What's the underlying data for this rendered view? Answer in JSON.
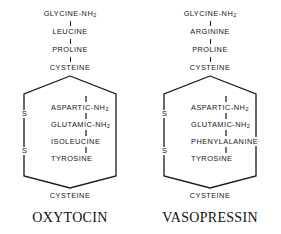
{
  "figure": {
    "background_color": "#ffffff",
    "ink_color": "#1a1a1a",
    "sulfur_symbol": "S"
  },
  "structures": [
    {
      "id": "oxytocin",
      "title": "OXYTOCIN",
      "tail": [
        {
          "name": "GLYCINE",
          "amide": "-NH",
          "sub": "2"
        },
        {
          "name": "LEUCINE",
          "amide": "",
          "sub": ""
        },
        {
          "name": "PROLINE",
          "amide": "",
          "sub": ""
        },
        {
          "name": "CYSTEINE",
          "amide": "",
          "sub": ""
        }
      ],
      "ring_residues": [
        {
          "name": "ASPARTIC",
          "amide": "-NH",
          "sub": "2"
        },
        {
          "name": "GLUTAMIC",
          "amide": "-NH",
          "sub": "2"
        },
        {
          "name": "ISOLEUCINE",
          "amide": "",
          "sub": ""
        },
        {
          "name": "TYROSINE",
          "amide": "",
          "sub": ""
        }
      ],
      "ring_bottom_residue": "CYSTEINE",
      "disulfide": [
        "S",
        "S"
      ]
    },
    {
      "id": "vasopressin",
      "title": "VASOPRESSIN",
      "tail": [
        {
          "name": "GLYCINE",
          "amide": "-NH",
          "sub": "2"
        },
        {
          "name": "ARGININE",
          "amide": "",
          "sub": ""
        },
        {
          "name": "PROLINE",
          "amide": "",
          "sub": ""
        },
        {
          "name": "CYSTEINE",
          "amide": "",
          "sub": ""
        }
      ],
      "ring_residues": [
        {
          "name": "ASPARTIC",
          "amide": "-NH",
          "sub": "2"
        },
        {
          "name": "GLUTAMIC",
          "amide": "-NH",
          "sub": "2"
        },
        {
          "name": "PHENYLALANINE",
          "amide": "",
          "sub": ""
        },
        {
          "name": "TYROSINE",
          "amide": "",
          "sub": ""
        }
      ],
      "ring_bottom_residue": "CYSTEINE",
      "disulfide": [
        "S",
        "S"
      ]
    }
  ]
}
